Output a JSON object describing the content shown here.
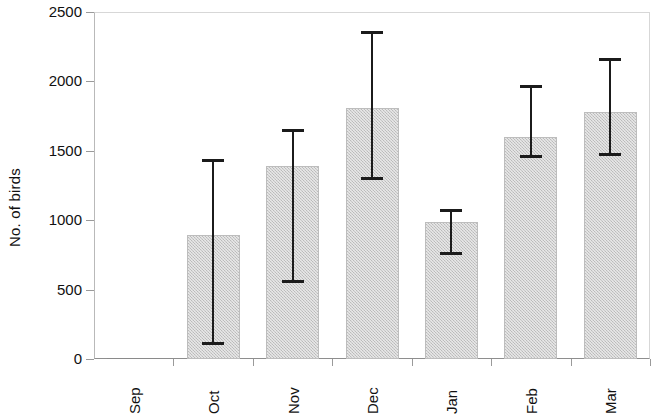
{
  "chart_data": {
    "type": "bar",
    "title": "",
    "subtitle": "",
    "xlabel": "",
    "ylabel": "No. of birds",
    "categories": [
      "Sep",
      "Oct",
      "Nov",
      "Dec",
      "Jan",
      "Feb",
      "Mar"
    ],
    "values": [
      5,
      890,
      1390,
      1810,
      985,
      1600,
      1780
    ],
    "error_low": [
      null,
      100,
      545,
      1290,
      750,
      1450,
      1465
    ],
    "error_high": [
      null,
      1440,
      1660,
      2360,
      1080,
      1975,
      2165
    ],
    "series": [
      {
        "name": "No. of birds",
        "values": [
          5,
          890,
          1390,
          1810,
          985,
          1600,
          1780
        ],
        "error_low": [
          null,
          100,
          545,
          1290,
          750,
          1450,
          1465
        ],
        "error_high": [
          null,
          1440,
          1660,
          2360,
          1080,
          1975,
          2165
        ]
      }
    ],
    "ylim": [
      0,
      2500
    ],
    "yticks": [
      0,
      500,
      1000,
      1500,
      2000,
      2500
    ],
    "ytick_labels": [
      "0",
      "500",
      "1000",
      "1500",
      "2000",
      "2500"
    ],
    "grid": false,
    "legend": false,
    "legend_position": "none",
    "bar_color": "#c9c9c9",
    "bar_edge_color": "#bdbdbd",
    "error_color": "#1b1b1b",
    "axis_color": "#8e8e8e",
    "background_color": "#ffffff",
    "annotations": []
  }
}
